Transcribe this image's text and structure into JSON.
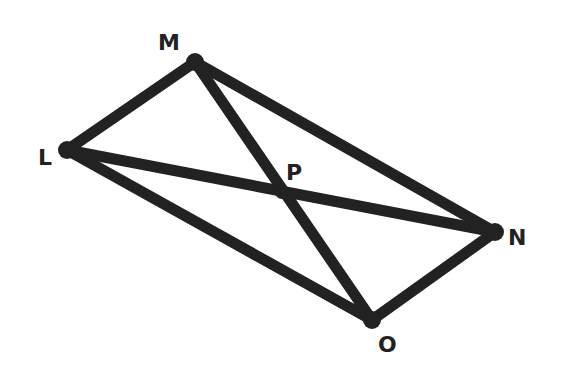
{
  "diagram": {
    "type": "parallelogram-with-diagonals",
    "stroke_color": "#222222",
    "background": "#ffffff",
    "vertices": {
      "M": {
        "label": "M",
        "x": 195,
        "y": 62,
        "label_x": 158,
        "label_y": 50
      },
      "L": {
        "label": "L",
        "x": 67,
        "y": 150,
        "label_x": 38,
        "label_y": 165
      },
      "N": {
        "label": "N",
        "x": 495,
        "y": 232,
        "label_x": 508,
        "label_y": 245
      },
      "O": {
        "label": "O",
        "x": 372,
        "y": 320,
        "label_x": 378,
        "label_y": 352
      },
      "P": {
        "label": "P",
        "x": 282,
        "y": 192,
        "label_x": 286,
        "label_y": 180
      }
    },
    "edges": [
      {
        "name": "side-LM",
        "from": "L",
        "to": "M"
      },
      {
        "name": "side-MN",
        "from": "M",
        "to": "N"
      },
      {
        "name": "side-NO",
        "from": "N",
        "to": "O"
      },
      {
        "name": "side-OL",
        "from": "O",
        "to": "L"
      },
      {
        "name": "diagonal-LN",
        "from": "L",
        "to": "N"
      },
      {
        "name": "diagonal-MO",
        "from": "M",
        "to": "O"
      }
    ]
  }
}
